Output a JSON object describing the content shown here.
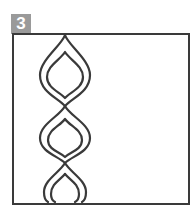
{
  "badge": {
    "label": "3",
    "color": "#9a9a9a"
  },
  "figure": {
    "stroke_color": "#3a3a3a",
    "lobe_count": 3
  }
}
